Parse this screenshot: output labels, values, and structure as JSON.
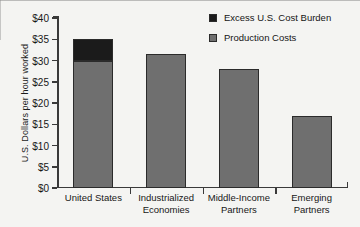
{
  "chart_data": {
    "type": "bar",
    "title": "",
    "xlabel": "",
    "ylabel": "U.S. Dollars per hour worked",
    "ylim": [
      0,
      40
    ],
    "ytick_values": [
      0,
      5,
      10,
      15,
      20,
      25,
      30,
      35,
      40
    ],
    "ytick_labels": [
      "$0",
      "$5",
      "$10",
      "$15",
      "$20",
      "$25",
      "$30",
      "$35",
      "$40"
    ],
    "grid": false,
    "stacked": true,
    "legend_position": "top-right",
    "categories": [
      "United States",
      "Industrialized Economies",
      "Middle-Income Partners",
      "Emerging Partners"
    ],
    "category_lines": [
      [
        "United States"
      ],
      [
        "Industrialized",
        "Economies"
      ],
      [
        "Middle-Income",
        "Partners"
      ],
      [
        "Emerging",
        "Partners"
      ]
    ],
    "series": [
      {
        "name": "Production Costs",
        "color": "#6f6f6f",
        "values": [
          30,
          31.5,
          28,
          17
        ]
      },
      {
        "name": "Excess U.S. Cost Burden",
        "color": "#1b1b1b",
        "values": [
          5,
          0,
          0,
          0
        ]
      }
    ],
    "totals": [
      35,
      31.5,
      28,
      17
    ]
  },
  "legend": {
    "items": [
      {
        "label": "Excess U.S. Cost Burden",
        "color": "#1b1b1b"
      },
      {
        "label": "Production Costs",
        "color": "#6f6f6f"
      }
    ]
  }
}
